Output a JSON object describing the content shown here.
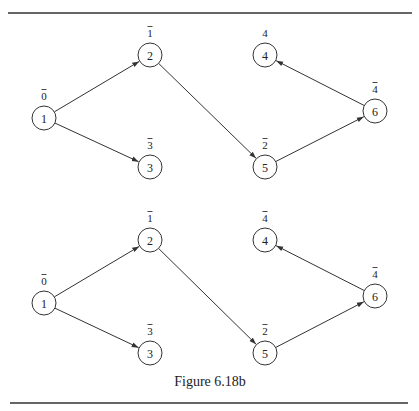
{
  "caption": "Figure 6.18b",
  "graphs": [
    {
      "name": "top-graph",
      "nodes": [
        {
          "id": "1",
          "label": "0",
          "label_bar": true,
          "x": 44,
          "y": 118
        },
        {
          "id": "2",
          "label": "1",
          "label_bar": true,
          "x": 150,
          "y": 55
        },
        {
          "id": "3",
          "label": "3",
          "label_bar": true,
          "x": 150,
          "y": 167
        },
        {
          "id": "4",
          "label": "4",
          "label_bar": false,
          "x": 265,
          "y": 55
        },
        {
          "id": "5",
          "label": "2",
          "label_bar": true,
          "x": 265,
          "y": 167
        },
        {
          "id": "6",
          "label": "4",
          "label_bar": true,
          "x": 375,
          "y": 111
        }
      ],
      "edges": [
        {
          "from": "1",
          "to": "2"
        },
        {
          "from": "1",
          "to": "3"
        },
        {
          "from": "2",
          "to": "5"
        },
        {
          "from": "5",
          "to": "6"
        },
        {
          "from": "6",
          "to": "4"
        }
      ]
    },
    {
      "name": "bottom-graph",
      "nodes": [
        {
          "id": "1",
          "label": "0",
          "label_bar": true,
          "x": 44,
          "y": 303
        },
        {
          "id": "2",
          "label": "1",
          "label_bar": true,
          "x": 150,
          "y": 240
        },
        {
          "id": "3",
          "label": "3",
          "label_bar": true,
          "x": 150,
          "y": 353
        },
        {
          "id": "4",
          "label": "4",
          "label_bar": true,
          "x": 265,
          "y": 240
        },
        {
          "id": "5",
          "label": "2",
          "label_bar": true,
          "x": 265,
          "y": 353
        },
        {
          "id": "6",
          "label": "4",
          "label_bar": true,
          "x": 375,
          "y": 296
        }
      ],
      "edges": [
        {
          "from": "1",
          "to": "2"
        },
        {
          "from": "1",
          "to": "3"
        },
        {
          "from": "2",
          "to": "5"
        },
        {
          "from": "5",
          "to": "6"
        },
        {
          "from": "6",
          "to": "4"
        }
      ]
    }
  ]
}
